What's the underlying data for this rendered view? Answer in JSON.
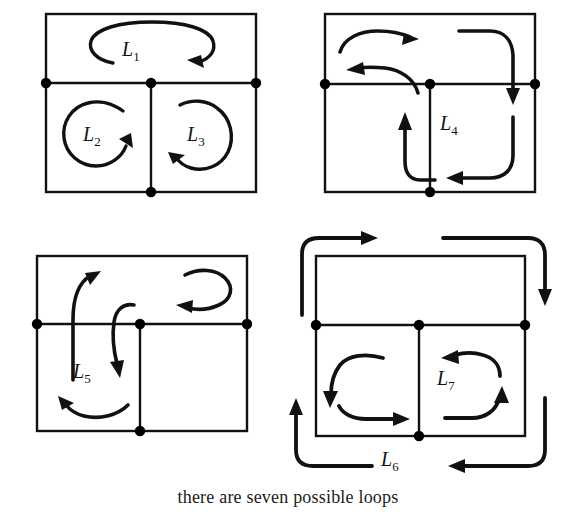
{
  "figure": {
    "caption": "there are seven possible loops",
    "colors": {
      "ink": "#111111",
      "node": "#000000",
      "background": "#ffffff"
    },
    "loops": [
      {
        "id": "L1",
        "letter": "L",
        "index": "1",
        "panel": "top-left",
        "direction": "clockwise",
        "shape": "ellipse-top-cell"
      },
      {
        "id": "L2",
        "letter": "L",
        "index": "2",
        "panel": "top-left",
        "direction": "clockwise",
        "shape": "circle-bottom-left-cell"
      },
      {
        "id": "L3",
        "letter": "L",
        "index": "3",
        "panel": "top-left",
        "direction": "counterclockwise",
        "shape": "circle-bottom-right-cell"
      },
      {
        "id": "L4",
        "letter": "L",
        "index": "4",
        "panel": "top-right",
        "direction": "clockwise",
        "shape": "top-and-bottom-right-cells"
      },
      {
        "id": "L5",
        "letter": "L",
        "index": "5",
        "panel": "bottom-left",
        "direction": "counterclockwise",
        "shape": "top-and-bottom-left-cells"
      },
      {
        "id": "L6",
        "letter": "L",
        "index": "6",
        "panel": "bottom-right",
        "direction": "counterclockwise",
        "shape": "outer-boundary"
      },
      {
        "id": "L7",
        "letter": "L",
        "index": "7",
        "panel": "bottom-right",
        "direction": "counterclockwise",
        "shape": "both-bottom-cells"
      }
    ],
    "panels": [
      {
        "name": "top-left",
        "labels": [
          "L1",
          "L2",
          "L3"
        ]
      },
      {
        "name": "top-right",
        "labels": [
          "L4"
        ]
      },
      {
        "name": "bottom-left",
        "labels": [
          "L5"
        ]
      },
      {
        "name": "bottom-right",
        "labels": [
          "L6",
          "L7"
        ]
      }
    ]
  }
}
